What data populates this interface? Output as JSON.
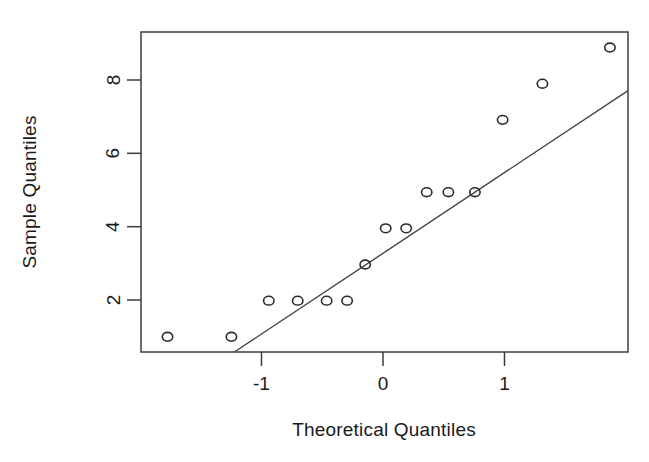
{
  "chart_data": {
    "type": "scatter",
    "title": "",
    "subtitle": "",
    "xlabel": "Theoretical Quantiles",
    "ylabel": "Sample Quantiles",
    "xlim": [
      -2.02,
      2.02
    ],
    "ylim": [
      0.58,
      9.43
    ],
    "xticks": [
      -1,
      0,
      1
    ],
    "xticklabels": [
      "-1",
      "0",
      "1"
    ],
    "yticks": [
      2,
      4,
      6,
      8
    ],
    "yticklabels": [
      "2",
      "4",
      "6",
      "8"
    ],
    "grid": false,
    "legend": null,
    "x": [
      -1.8,
      -1.27,
      -0.96,
      -0.72,
      -0.48,
      -0.31,
      -0.16,
      0.01,
      0.18,
      0.35,
      0.53,
      0.75,
      0.98,
      1.31,
      1.87
    ],
    "y": [
      1,
      1,
      2,
      2,
      2,
      2,
      3,
      4,
      4,
      5,
      5,
      5,
      7,
      8,
      9
    ],
    "point_marker": "open-circle",
    "reference_line": {
      "label": "qqline",
      "x_start": -1.245,
      "y_start": 0.58,
      "x_end": 2.02,
      "y_end": 7.81
    },
    "colors": {
      "point_stroke": "#2a2a32",
      "line": "#44444e",
      "frame": "#3b3b44",
      "text": "#1a1a1a",
      "background": "#ffffff"
    }
  },
  "plot": {
    "x_axis_label": "Theoretical Quantiles",
    "y_axis_label": "Sample Quantiles",
    "x_tick_labels": [
      "-1",
      "0",
      "1"
    ],
    "y_tick_labels": [
      "2",
      "4",
      "6",
      "8"
    ]
  }
}
